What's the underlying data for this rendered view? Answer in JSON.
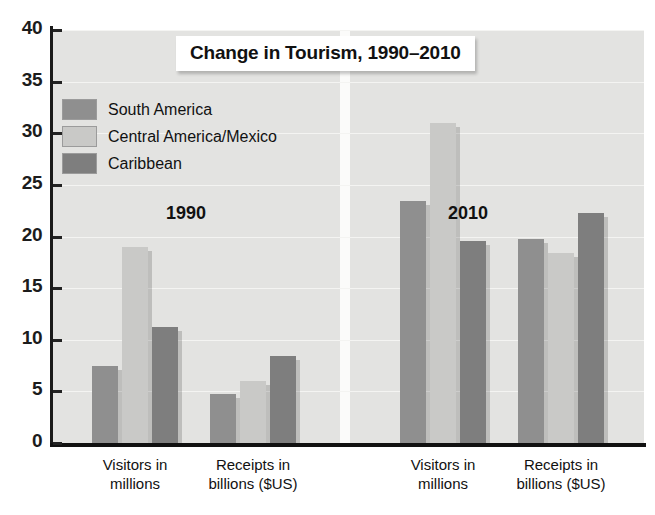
{
  "chart_data": {
    "type": "bar",
    "title": "Change in Tourism, 1990–2010",
    "xlabel": "",
    "ylabel": "",
    "ylim": [
      0,
      40
    ],
    "yticks": [
      0,
      5,
      10,
      15,
      20,
      25,
      30,
      35,
      40
    ],
    "grid": true,
    "legend_position": "upper-left-inside",
    "panels": [
      {
        "name": "1990",
        "categories": [
          "Visitors in millions",
          "Receipts in billions ($US)"
        ],
        "series": [
          {
            "name": "South America",
            "values": [
              7.5,
              4.7
            ]
          },
          {
            "name": "Central America/Mexico",
            "values": [
              19.0,
              6.0
            ]
          },
          {
            "name": "Caribbean",
            "values": [
              11.2,
              8.4
            ]
          }
        ]
      },
      {
        "name": "2010",
        "categories": [
          "Visitors in millions",
          "Receipts in billions ($US)"
        ],
        "series": [
          {
            "name": "South America",
            "values": [
              23.4,
              19.8
            ]
          },
          {
            "name": "Central America/Mexico",
            "values": [
              31.0,
              18.4
            ]
          },
          {
            "name": "Caribbean",
            "values": [
              19.6,
              22.3
            ]
          }
        ]
      }
    ],
    "series_colors": {
      "South America": "#8f8f8f",
      "Central America/Mexico": "#c9c9c7",
      "Caribbean": "#7e7e7e"
    }
  },
  "title": {
    "text": "Change in Tourism, 1990–2010"
  },
  "legend": {
    "items": [
      {
        "label": "South America",
        "color": "#8f8f8f"
      },
      {
        "label": "Central America/Mexico",
        "color": "#c9c9c7"
      },
      {
        "label": "Caribbean",
        "color": "#7e7e7e"
      }
    ]
  },
  "y_axis": {
    "ticks": [
      "40",
      "35",
      "30",
      "25",
      "20",
      "15",
      "10",
      "5",
      "0"
    ]
  },
  "annotations": {
    "year_left": "1990",
    "year_right": "2010"
  },
  "x_axis": {
    "groups": [
      {
        "line1": "Visitors in",
        "line2": "millions"
      },
      {
        "line1": "Receipts in",
        "line2": "billions ($US)"
      },
      {
        "line1": "Visitors in",
        "line2": "millions"
      },
      {
        "line1": "Receipts in",
        "line2": "billions ($US)"
      }
    ]
  }
}
